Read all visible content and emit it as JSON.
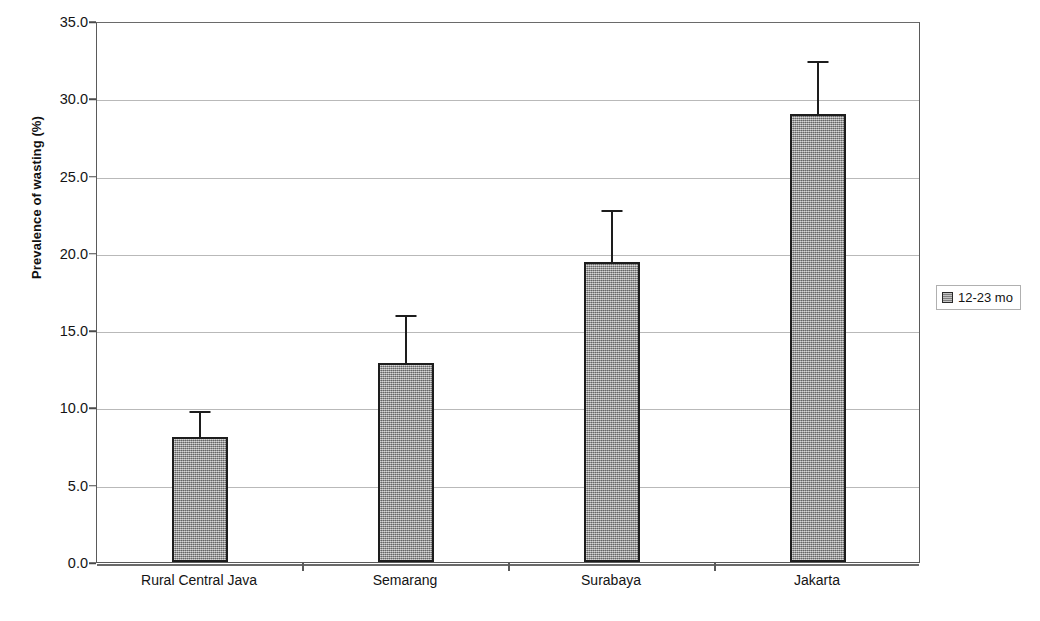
{
  "chart_data": {
    "type": "bar",
    "title": "",
    "xlabel": "",
    "ylabel": "Prevalence of wasting (%)",
    "categories": [
      "Rural Central Java",
      "Semarang",
      "Surabaya",
      "Jakarta"
    ],
    "series": [
      {
        "name": "12-23 mo",
        "values": [
          8.1,
          12.9,
          19.4,
          29.0
        ],
        "error_upper": [
          9.8,
          16.0,
          22.8,
          32.4
        ],
        "color": "#a3a3a3"
      }
    ],
    "ylim": [
      0.0,
      35.0
    ],
    "ytick_step": 5.0,
    "ytick_labels": [
      "0.0",
      "5.0",
      "10.0",
      "15.0",
      "20.0",
      "25.0",
      "30.0",
      "35.0"
    ],
    "grid": true,
    "legend_position": "right-outside",
    "error_bar_style": "upper-cap-only"
  },
  "legend": {
    "entries": [
      {
        "label": "12-23 mo",
        "swatch": "legend-swatch"
      }
    ]
  }
}
